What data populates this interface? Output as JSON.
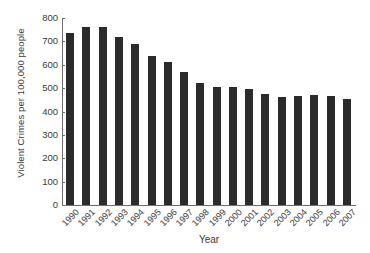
{
  "chart_data": {
    "type": "bar",
    "title": "",
    "xlabel": "Year",
    "ylabel": "Violent Crimes per 100,000 people",
    "categories": [
      "1990",
      "1991",
      "1992",
      "1993",
      "1994",
      "1995",
      "1996",
      "1997",
      "1998",
      "1999",
      "2000",
      "2001",
      "2002",
      "2003",
      "2004",
      "2005",
      "2006",
      "2007"
    ],
    "values": [
      735,
      760,
      760,
      718,
      688,
      638,
      612,
      567,
      523,
      507,
      506,
      495,
      477,
      463,
      466,
      471,
      465,
      452
    ],
    "series": [
      {
        "name": "Violent Crimes per 100,000 people",
        "values": [
          735,
          760,
          760,
          718,
          688,
          638,
          612,
          567,
          523,
          507,
          506,
          495,
          477,
          463,
          466,
          471,
          465,
          452
        ]
      }
    ],
    "ylim": [
      0,
      800
    ],
    "ytick_values": [
      0,
      100,
      200,
      300,
      400,
      500,
      600,
      700,
      800
    ],
    "ytick_labels": [
      "0",
      "100",
      "200",
      "300",
      "400",
      "500",
      "600",
      "700",
      "800"
    ],
    "grid": false,
    "legend": false,
    "bar_color": "#2b2b2b",
    "axis_color": "#6e6e6e",
    "background_color": "#ffffff"
  }
}
